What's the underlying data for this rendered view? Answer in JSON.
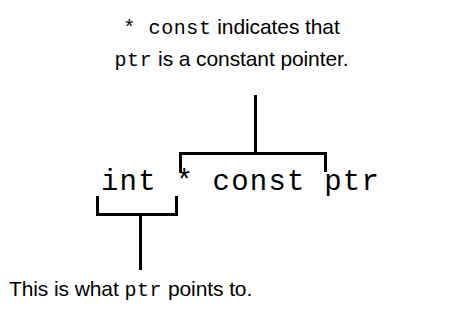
{
  "figure": {
    "background_color": "#ffffff",
    "line_color": "#000000",
    "text_color": "#000000"
  },
  "top_annotation": {
    "line1_code": "* const",
    "line1_text": " indicates that",
    "line2_code": "ptr",
    "line2_text": " is a constant pointer."
  },
  "code_line": {
    "full": "int * const ptr",
    "type_token": "int",
    "pointer_token": "*",
    "qualifier_token": "const",
    "identifier_token": "ptr"
  },
  "bottom_annotation": {
    "text_before": "This is what ",
    "code": "ptr",
    "text_after": " points to."
  },
  "connectors": {
    "top_stem_label": "stem from top annotation to const brace",
    "top_brace_label": "overbrace spanning * const",
    "bottom_brace_label": "underbrace spanning int",
    "bottom_stem_label": "stem from int brace to bottom annotation"
  }
}
